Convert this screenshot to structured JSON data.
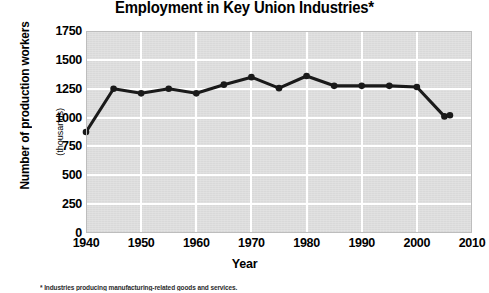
{
  "title": "Employment in Key Union Industries*",
  "x_axis_title": "Year",
  "y_axis_title": "Number of production workers",
  "y_axis_subtitle": "(thousands)",
  "footnote": "* Industries producing manufacturing-related goods and services.",
  "colors": {
    "plot_background": "#d9d9d9",
    "gridline": "#ffffff",
    "line": "#1a1a1a",
    "marker": "#1a1a1a",
    "text": "#000000"
  },
  "chart_data": {
    "type": "line",
    "title": "Employment in Key Union Industries*",
    "xlabel": "Year",
    "ylabel": "Number of production workers (thousands)",
    "xlim": [
      1940,
      2010
    ],
    "ylim": [
      0,
      1750
    ],
    "xticks": [
      1940,
      1950,
      1960,
      1970,
      1980,
      1990,
      2000,
      2010
    ],
    "yticks": [
      0,
      250,
      500,
      750,
      1000,
      1250,
      1500,
      1750
    ],
    "grid": true,
    "legend": false,
    "marker": "circle",
    "x": [
      1940,
      1945,
      1950,
      1955,
      1960,
      1965,
      1970,
      1975,
      1980,
      1985,
      1990,
      1995,
      2000,
      2005,
      2006
    ],
    "values": [
      875,
      1250,
      1210,
      1250,
      1210,
      1285,
      1350,
      1255,
      1360,
      1275,
      1275,
      1275,
      1265,
      1010,
      1020
    ],
    "series": [
      {
        "name": "Number of production workers (thousands)",
        "x": [
          1940,
          1945,
          1950,
          1955,
          1960,
          1965,
          1970,
          1975,
          1980,
          1985,
          1990,
          1995,
          2000,
          2005,
          2006
        ],
        "values": [
          875,
          1250,
          1210,
          1250,
          1210,
          1285,
          1350,
          1255,
          1360,
          1275,
          1275,
          1275,
          1265,
          1010,
          1020
        ]
      }
    ]
  }
}
